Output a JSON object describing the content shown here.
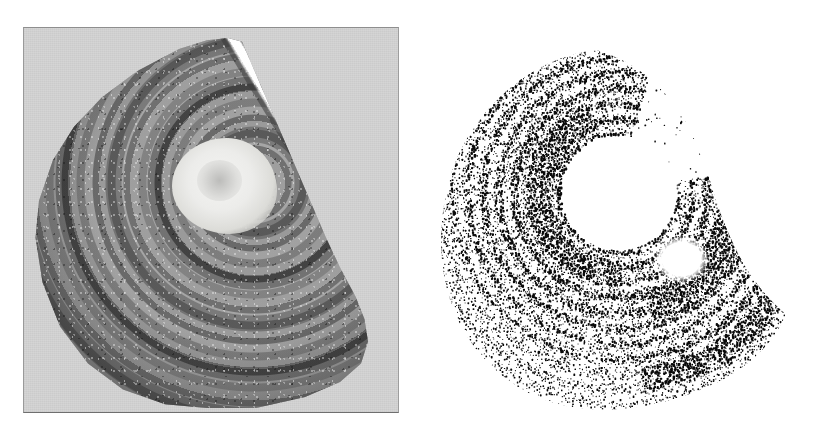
{
  "figure": {
    "title": "",
    "caption": "",
    "background_color": "#ffffff",
    "panel_count": 2
  },
  "panels": [
    {
      "id": "left",
      "name": "grayscale-photomicrograph",
      "label": "",
      "description": "Grayscale photograph of a sectioned shell/otolith half-disc showing concentric growth rings, a bright calcified nucleus and a white radial cut face.",
      "frame": {
        "x": 23,
        "y": 27,
        "width": 376,
        "height": 386
      },
      "mount_color": "#d5d5d5",
      "border_color": "#8e8e8e",
      "features": [
        {
          "name": "outer-cortex",
          "tone": "dark-gray",
          "color": "#3c3c3c"
        },
        {
          "name": "growth-rings",
          "tone": "alternating",
          "count_visible": 9
        },
        {
          "name": "nucleus-core",
          "tone": "bright",
          "color": "#f2f2f0"
        },
        {
          "name": "radial-cut-face",
          "tone": "white",
          "color": "#ffffff",
          "angle_deg": -31
        }
      ]
    },
    {
      "id": "right",
      "name": "binarized-threshold-image",
      "label": "",
      "description": "Black-and-white thresholded version of the same section; dense black stipple marks the mineralized rings, white voids mark the nucleus and the cut face.",
      "frame": {
        "x": 420,
        "y": 14,
        "width": 390,
        "height": 412
      },
      "background_color": "#ffffff",
      "ink_color": "#0a0a0a",
      "features": [
        {
          "name": "dense-arc-band",
          "tone": "solid-black"
        },
        {
          "name": "nucleus-void",
          "tone": "white"
        },
        {
          "name": "scatter-noise",
          "tone": "sparse-black"
        }
      ]
    }
  ],
  "chart_data": {
    "type": "heatmap",
    "title": "",
    "xlabel": "",
    "ylabel": "",
    "legend": [],
    "annotations": [],
    "grid": false
  }
}
